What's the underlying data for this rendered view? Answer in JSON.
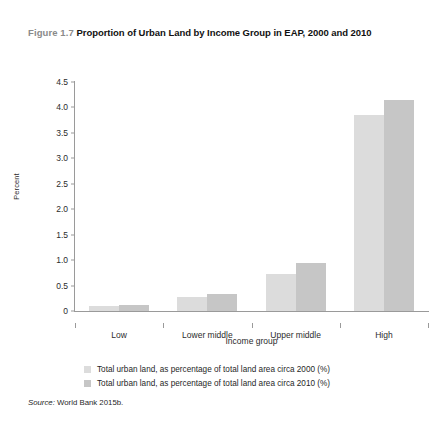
{
  "figure": {
    "number": "Figure 1.7",
    "title": "Proportion of Urban Land by Income Group in EAP, 2000 and 2010"
  },
  "source": {
    "label": "Source:",
    "text": "World Bank 2015b."
  },
  "colors": {
    "series_2000": "#dcdcdc",
    "series_2010": "#c6c6c6",
    "axis": "#9a9a9a",
    "text": "#1f1f1f",
    "fignum": "#8a8a8a"
  },
  "chart_data": {
    "type": "bar",
    "title": "Proportion of Urban Land by Income Group in EAP, 2000 and 2010",
    "xlabel": "Income group",
    "ylabel": "Percent",
    "categories": [
      "Low",
      "Lower middle",
      "Upper middle",
      "High"
    ],
    "series": [
      {
        "name": "Total urban land, as percentage of total land area circa 2000 (%)",
        "values": [
          0.1,
          0.27,
          0.73,
          3.85
        ]
      },
      {
        "name": "Total urban land, as percentage of total land area circa 2010 (%)",
        "values": [
          0.11,
          0.33,
          0.95,
          4.15
        ]
      }
    ],
    "ylim": [
      0,
      4.5
    ],
    "yticks": [
      "0",
      "0.5",
      "1.0",
      "1.5",
      "2.0",
      "2.5",
      "3.0",
      "3.5",
      "4.0",
      "4.5"
    ],
    "ytick_values": [
      0,
      0.5,
      1.0,
      1.5,
      2.0,
      2.5,
      3.0,
      3.5,
      4.0,
      4.5
    ],
    "grid": false,
    "legend_position": "bottom"
  }
}
